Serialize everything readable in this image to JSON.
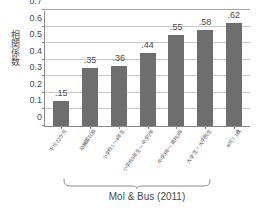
{
  "chart_data": {
    "type": "bar",
    "title": "",
    "xlabel": "",
    "ylabel": "相関係数",
    "ylim": [
      0,
      0.7
    ],
    "grid": true,
    "legend": null,
    "categories": [
      "平均22か月",
      "幼稚園以前",
      "小学校1〜4年生",
      "小学校5年生〜中学2年",
      "中学3年〜高校3年",
      "大学生・大学院生",
      "平均7.1歳"
    ],
    "values": [
      0.15,
      0.35,
      0.36,
      0.44,
      0.55,
      0.58,
      0.62
    ],
    "value_labels": [
      ".15",
      ".35",
      ".36",
      ".44",
      ".55",
      ".58",
      ".62"
    ],
    "ytick_labels": [
      "0.7",
      "0.6",
      "0.5",
      "0.4",
      "0.3",
      "0.2",
      "0.1",
      "0"
    ],
    "ytick_values": [
      0.7,
      0.6,
      0.5,
      0.4,
      0.3,
      0.2,
      0.1,
      0
    ],
    "annotations": [
      {
        "text": "Mol & Bus (2011)",
        "type": "bracket-caption",
        "covers_categories": [
          1,
          2,
          3,
          4,
          5
        ]
      }
    ],
    "colors": {
      "bar": "#6e6e6e",
      "gridline": "#c9c9c9",
      "axis": "#8a8a8a",
      "text": "#4a4a4a",
      "background": "#ffffff"
    }
  },
  "caption": {
    "bracket_label": "Mol & Bus (2011)"
  }
}
